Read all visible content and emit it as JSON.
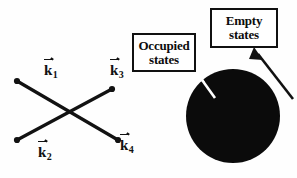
{
  "figure": {
    "background_color": "#fefefe",
    "ink_color": "#111111"
  },
  "scattering_diagram": {
    "name": "two-electron scattering vertex",
    "vectors": [
      {
        "id": "k1",
        "base": "k",
        "subscript": "1",
        "label": "k",
        "position": "upper-left"
      },
      {
        "id": "k2",
        "base": "k",
        "subscript": "2",
        "label": "k",
        "position": "lower-left"
      },
      {
        "id": "k3",
        "base": "k",
        "subscript": "3",
        "label": "k",
        "position": "upper-right"
      },
      {
        "id": "k4",
        "base": "k",
        "subscript": "4",
        "label": "k",
        "position": "lower-right"
      }
    ],
    "lines": [
      {
        "id": "line-k1-k4",
        "from": [
          17,
          81
        ],
        "to": [
          118,
          140
        ]
      },
      {
        "id": "line-k2-k3",
        "from": [
          17,
          140
        ],
        "to": [
          112,
          89
        ]
      }
    ],
    "endpoint_dots": [
      {
        "id": "dot-k1",
        "cx": 17,
        "cy": 81
      },
      {
        "id": "dot-k2",
        "cx": 17,
        "cy": 140
      },
      {
        "id": "dot-k3",
        "cx": 112,
        "cy": 89
      },
      {
        "id": "dot-k4",
        "cx": 118,
        "cy": 140
      }
    ],
    "crossing_point": [
      64,
      113
    ]
  },
  "fermi_sphere": {
    "name": "filled Fermi sea disk",
    "fill_color": "#0b0b0b",
    "center": [
      233,
      116
    ],
    "radius": 47
  },
  "callouts": [
    {
      "id": "occupied",
      "line1": "Occupied",
      "line2": "states",
      "arrow_color": "#ffffff",
      "arrow_from": [
        196,
        72
      ],
      "arrow_to": [
        216,
        99
      ],
      "points_at": "inside-of-disk"
    },
    {
      "id": "empty",
      "line1": "Empty",
      "line2": "states",
      "arrow_color": "#111111",
      "arrow_from": [
        292,
        97
      ],
      "arrow_to": [
        256,
        50
      ],
      "points_at": "outside-of-disk"
    }
  ]
}
